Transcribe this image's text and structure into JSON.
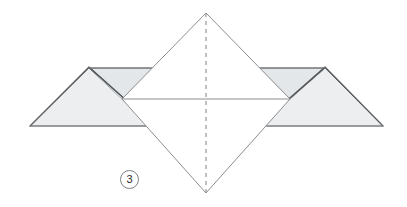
{
  "figure": {
    "kind": "origami-fold-diagram",
    "step_label": "3",
    "canvas": {
      "width": 407,
      "height": 207
    },
    "background_color": "#ffffff"
  },
  "palette": {
    "paper_front": "#ffffff",
    "paper_back_light": "#eef0f1",
    "paper_back_mid": "#e7eaec",
    "paper_back_dark": "#dfe3e5",
    "edge_stroke": "#6e7174",
    "edge_stroke_soft": "#9a9da0",
    "crease_stroke": "#8b8e91",
    "shadow_stroke": "#4a4c4e",
    "badge_stroke": "#7d7f82",
    "badge_text": "#2b2b2b"
  },
  "geometry": {
    "diamond": {
      "name": "central-diamond",
      "apex_top": [
        206,
        13
      ],
      "apex_bottom": [
        206,
        193
      ],
      "left_mid": [
        122,
        99
      ],
      "right_mid": [
        290,
        99
      ]
    },
    "center_line": {
      "name": "horizontal-crease",
      "x1": 122,
      "y1": 99,
      "x2": 290,
      "y2": 99
    },
    "fold_line": {
      "name": "vertical-dashed-fold",
      "x": 206,
      "y1": 13,
      "y2": 193,
      "dash": "4 4"
    },
    "left_wing": {
      "name": "left-wing-flap",
      "tip": [
        30,
        126
      ],
      "peak": [
        89,
        68
      ],
      "inner_bottom": [
        155,
        126
      ],
      "top_edge_end": [
        155,
        68
      ]
    },
    "right_wing": {
      "name": "right-wing-flap",
      "tip": [
        383,
        126
      ],
      "peak": [
        325,
        68
      ],
      "inner_bottom": [
        258,
        126
      ],
      "top_edge_end": [
        258,
        68
      ]
    }
  },
  "badge": {
    "text": "3",
    "left": 120,
    "top": 170
  }
}
